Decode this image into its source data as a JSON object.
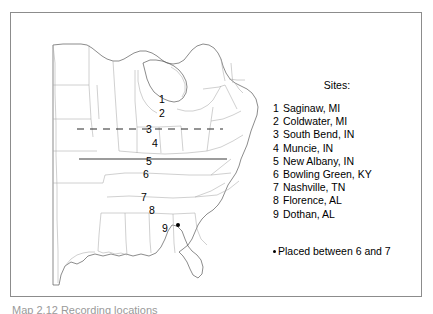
{
  "figure": {
    "legend_title": "Sites:",
    "note_text": "Placed between 6 and 7",
    "caption_partial": "Map 2.12 Recording locations"
  },
  "sites": [
    {
      "number": "1",
      "name": "Saginaw, MI",
      "x": 148,
      "y": 83
    },
    {
      "number": "2",
      "name": "Coldwater, MI",
      "x": 148,
      "y": 97
    },
    {
      "number": "3",
      "name": "South Bend, IN",
      "x": 135,
      "y": 113
    },
    {
      "number": "4",
      "name": "Muncie, IN",
      "x": 141,
      "y": 127
    },
    {
      "number": "5",
      "name": "New Albany, IN",
      "x": 135,
      "y": 145
    },
    {
      "number": "6",
      "name": "Bowling Green, KY",
      "x": 132,
      "y": 158
    },
    {
      "number": "7",
      "name": "Nashville, TN",
      "x": 130,
      "y": 181
    },
    {
      "number": "8",
      "name": "Florence, AL",
      "x": 138,
      "y": 194
    },
    {
      "number": "9",
      "name": "Dothan, AL",
      "x": 151,
      "y": 212
    }
  ],
  "marker": {
    "name": "placed-dot",
    "x": 165,
    "y": 209
  },
  "reference_lines": {
    "dashed": {
      "x1": 66,
      "x2": 212,
      "y": 118
    },
    "solid": {
      "x1": 68,
      "x2": 216,
      "y": 148
    }
  },
  "colors": {
    "frame": "#8c8c8c",
    "coastline": "#5a5a5a",
    "state_border": "#a8a8a8",
    "text": "#000000",
    "marker": "#000000"
  }
}
